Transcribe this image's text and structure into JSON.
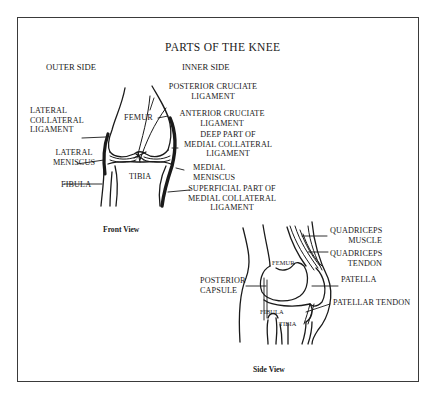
{
  "diagram": {
    "title": "PARTS OF THE KNEE",
    "front_view": {
      "caption": "Front View",
      "side_headers": {
        "outer": "OUTER SIDE",
        "inner": "INNER SIDE"
      },
      "bones": {
        "femur": "FEMUR",
        "tibia": "TIBIA"
      },
      "labels": {
        "lateral_collateral": [
          "LATERAL",
          "COLLATERAL",
          "LIGAMENT"
        ],
        "lateral_meniscus": [
          "LATERAL",
          "MENISCUS"
        ],
        "fibula": "FIBULA",
        "posterior_cruciate": [
          "POSTERIOR CRUCIATE",
          "LIGAMENT"
        ],
        "anterior_cruciate": [
          "ANTERIOR CRUCIATE",
          "LIGAMENT"
        ],
        "deep_medial_collateral": [
          "DEEP PART OF",
          "MEDIAL COLLATERAL",
          "LIGAMENT"
        ],
        "medial_meniscus": [
          "MEDIAL",
          "MENISCUS"
        ],
        "superficial_medial_collateral": [
          "SUPERFICIAL PART OF",
          "MEDIAL COLLATERAL",
          "LIGAMENT"
        ]
      }
    },
    "side_view": {
      "caption": "Side View",
      "bones": {
        "femur": "FEMUR",
        "fibula": "FIBULA",
        "tibia": "TIBIA"
      },
      "labels": {
        "posterior_capsule": [
          "POSTERIOR",
          "CAPSULE"
        ],
        "quadriceps_muscle": [
          "QUADRICEPS",
          "MUSCLE"
        ],
        "quadriceps_tendon": [
          "QUADRICEPS",
          "TENDON"
        ],
        "patella": "PATELLA",
        "patellar_tendon": "PATELLAR TENDON"
      }
    }
  }
}
